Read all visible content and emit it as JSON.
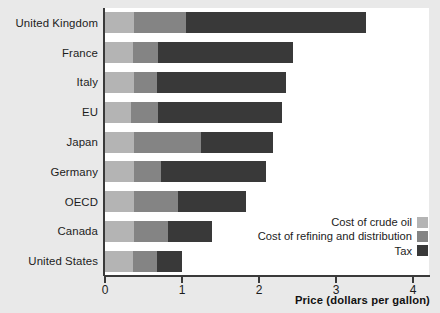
{
  "chart_data": {
    "type": "bar",
    "orientation": "horizontal",
    "stacked": true,
    "title": "",
    "xlabel": "Price (dollars per gallon)",
    "ylabel": "",
    "xlim": [
      0,
      4
    ],
    "xticks": [
      "0",
      "1",
      "2",
      "3",
      "4"
    ],
    "grid": false,
    "legend_position": "inside-bottom-right",
    "categories": [
      "United Kingdom",
      "France",
      "Italy",
      "EU",
      "Japan",
      "Germany",
      "OECD",
      "Canada",
      "United States"
    ],
    "series": [
      {
        "name": "Cost of crude oil",
        "color": "#b4b4b4",
        "values": [
          0.38,
          0.36,
          0.38,
          0.34,
          0.38,
          0.38,
          0.38,
          0.38,
          0.36
        ]
      },
      {
        "name": "Cost of refining and distribution",
        "color": "#848484",
        "values": [
          0.67,
          0.33,
          0.29,
          0.35,
          0.87,
          0.35,
          0.57,
          0.44,
          0.31
        ]
      },
      {
        "name": "Tax",
        "color": "#393939",
        "values": [
          2.34,
          1.75,
          1.68,
          1.61,
          0.93,
          1.36,
          0.88,
          0.57,
          0.33
        ]
      }
    ],
    "totals": [
      3.39,
      2.44,
      2.35,
      2.3,
      2.18,
      2.09,
      1.83,
      1.39,
      1.0
    ]
  },
  "legend": {
    "items": [
      {
        "label": "Cost of crude oil",
        "color": "#b4b4b4"
      },
      {
        "label": "Cost of refining and distribution",
        "color": "#848484"
      },
      {
        "label": "Tax",
        "color": "#393939"
      }
    ]
  },
  "axis": {
    "x_title": "Price (dollars per gallon)"
  },
  "colors": {
    "background": "#e9e9e9",
    "plot_background": "#ffffff",
    "axis": "#3a3a3a",
    "text": "#1c1c1c"
  }
}
